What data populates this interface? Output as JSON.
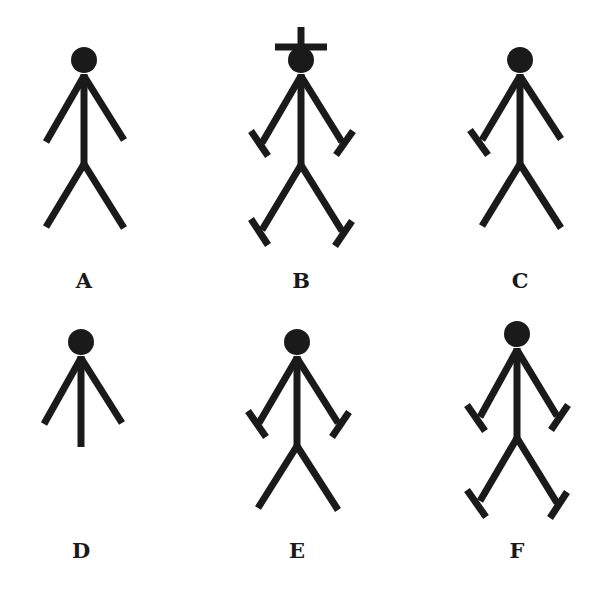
{
  "colors": {
    "ink": "#1a1a1a",
    "background": "#ffffff"
  },
  "figures": [
    {
      "id": "A",
      "label": "A",
      "cross": false,
      "hands": [
        false,
        false
      ],
      "feet": [
        false,
        false
      ],
      "legs": true
    },
    {
      "id": "B",
      "label": "B",
      "cross": true,
      "hands": [
        true,
        true
      ],
      "feet": [
        true,
        true
      ],
      "legs": true
    },
    {
      "id": "C",
      "label": "C",
      "cross": false,
      "hands": [
        true,
        false
      ],
      "feet": [
        false,
        false
      ],
      "legs": true
    },
    {
      "id": "D",
      "label": "D",
      "cross": false,
      "hands": [
        false,
        false
      ],
      "feet": [
        false,
        false
      ],
      "legs": false
    },
    {
      "id": "E",
      "label": "E",
      "cross": false,
      "hands": [
        true,
        true
      ],
      "feet": [
        false,
        false
      ],
      "legs": true
    },
    {
      "id": "F",
      "label": "F",
      "cross": false,
      "hands": [
        true,
        true
      ],
      "feet": [
        true,
        true
      ],
      "legs": true
    }
  ]
}
